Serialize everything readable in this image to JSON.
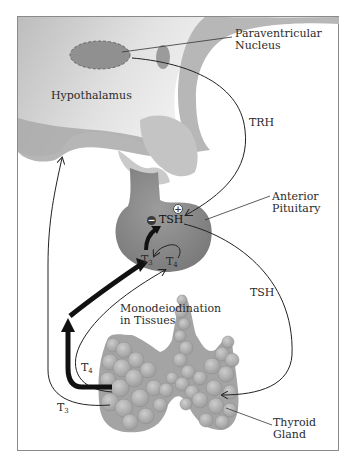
{
  "figure": {
    "colors": {
      "frame": "#8a8a8a",
      "hypothalamus_light": "#dcdcdc",
      "hypothalamus_dark": "#b4b4b4",
      "pituitary": "#8e8e8e",
      "thyroid": "#a8a8a8",
      "arrow": "#111111"
    }
  },
  "labels": {
    "paraventricular_line1": "Paraventricular",
    "paraventricular_line2": "Nucleus",
    "hypothalamus": "Hypothalamus",
    "trh": "TRH",
    "anterior_line1": "Anterior",
    "anterior_line2": "Pituitary",
    "tsh_in_pituitary": "TSH",
    "tsh_pathway": "TSH",
    "t3_pituitary": "T",
    "t3_pituitary_sub": "3",
    "t4_pituitary": "T",
    "t4_pituitary_sub": "4",
    "monodeiodination_line1": "Monodeiodination",
    "monodeiodination_line2": "in Tissues",
    "t4_thyroid": "T",
    "t4_thyroid_sub": "4",
    "t3_thyroid": "T",
    "t3_thyroid_sub": "3",
    "thyroid_line1": "Thyroid",
    "thyroid_line2": "Gland",
    "minus_sign": "−",
    "plus_sign": "+"
  }
}
